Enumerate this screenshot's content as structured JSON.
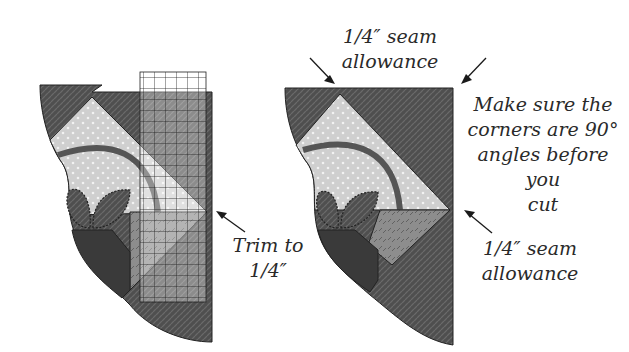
{
  "figure": {
    "left_panel": {
      "name": "block-with-ruler",
      "callout": {
        "line1": "Trim to",
        "line2": "1/4″"
      }
    },
    "right_panel": {
      "name": "trimmed-block",
      "callout_top": {
        "line1": "1/4″ seam",
        "line2": "allowance"
      },
      "callout_right": {
        "line1": "Make sure the",
        "line2": "corners are 90°",
        "line3": "angles before you",
        "line4": "cut"
      },
      "callout_bottom": {
        "line1": "1/4″ seam",
        "line2": "allowance"
      }
    }
  },
  "colors": {
    "dark_fabric": "#4f4f4f",
    "light_fabric": "#cfcfcf",
    "mid_fabric": "#8d8d8d",
    "darkest_fabric": "#3a3a3a",
    "ruler_grid": "#1e1e1e",
    "arrow": "#1a1a1a"
  }
}
